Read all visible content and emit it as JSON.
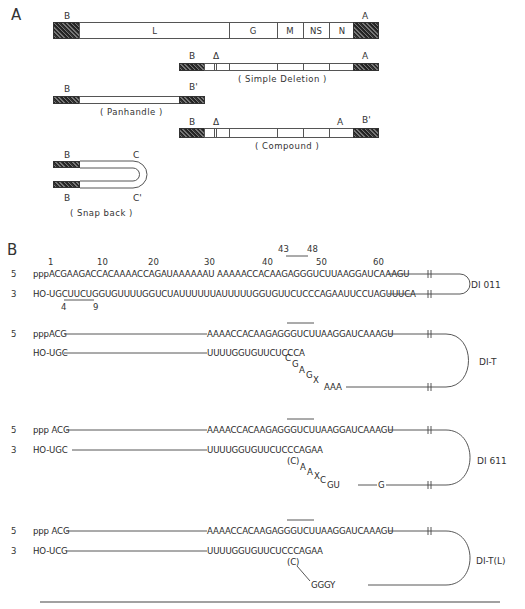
{
  "panel_a": {
    "label": "A",
    "standard_genome": {
      "left_end": "B",
      "right_end": "A",
      "genes": [
        "L",
        "G",
        "M",
        "NS",
        "N"
      ]
    },
    "simple_deletion": {
      "left": "B",
      "delta": "Δ",
      "right": "A",
      "caption": "( Simple Deletion )"
    },
    "panhandle": {
      "left": "B",
      "right": "B'",
      "caption": "( Panhandle )"
    },
    "compound": {
      "left": "B",
      "delta": "Δ",
      "inner": "A",
      "right": "B'",
      "caption": "( Compound )"
    },
    "snapback": {
      "top_left": "B",
      "top_right": "C",
      "bottom_left": "B",
      "bottom_right": "C'",
      "caption": "( Snap back )"
    }
  },
  "panel_b": {
    "label": "B",
    "position_numbers": [
      "1",
      "10",
      "20",
      "30",
      "40",
      "50",
      "60"
    ],
    "box_top": {
      "start": "43",
      "end": "48"
    },
    "box_bottom": {
      "start": "4",
      "end": "9"
    },
    "di011": {
      "name": "DI 011",
      "top_end": "5",
      "top_seq": "pppACGAAGACCACAAAACCAGAUAAAAAAU AAAAACCACAAGAGGGUCUUAAGGAUCAAAGU",
      "bottom_end": "3",
      "bottom_seq": "HO-UGCUUCUGGUGUUUUGGUCUAUUUUUUAUUUUUGGUGUUCUCCCAGAAUUCCUAGUUUCA"
    },
    "dit": {
      "name": "DI-T",
      "top_end": "5",
      "top_prefix": "pppACG",
      "top_seq": "AAAACCACAAGAGGGUCUUAAGGAUCAAAGU",
      "bottom_prefix": "HO-UGC",
      "bottom_seq": "UUUUGGUGUUCUCCCA",
      "loop_bases": [
        "C",
        "G",
        "A",
        "G",
        "X"
      ],
      "loop_tail": "AAA"
    },
    "di611": {
      "name": "DI 611",
      "top_end": "5",
      "top_prefix": "ppp ACG",
      "top_seq": "AAAACCACAAGAGGGUCUUAAGGAUCAAAGU",
      "bottom_end": "3",
      "bottom_prefix": "HO-UGC",
      "bottom_seq": "UUUUGGUGUUCUCCCAGAA",
      "loop_bases": [
        "(C)",
        "A",
        "A",
        "X",
        "C"
      ],
      "loop_tail": "GU",
      "loop_g": "G"
    },
    "ditl": {
      "name": "DI-T(L)",
      "top_end": "5",
      "top_prefix": "ppp ACG",
      "top_seq": "AAAACCACAAGAGGGUCUUAAGGAUCAAAGU",
      "bottom_end": "3",
      "bottom_prefix": "HO-UCG",
      "bottom_seq": "UUUUGGUGUUCUCCCAGAA",
      "loop_c": "(C)",
      "loop_tail": "GGGY"
    }
  }
}
